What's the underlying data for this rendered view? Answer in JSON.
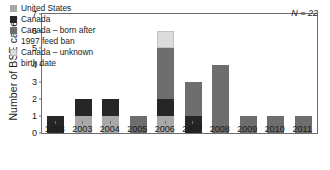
{
  "chart_data": {
    "type": "bar",
    "title": "",
    "subtitle": "",
    "xlabel": "",
    "ylabel": "Number of BSE cases",
    "ylim": [
      0,
      7
    ],
    "yticks": [
      0,
      1,
      2,
      3,
      4,
      5,
      6,
      7
    ],
    "grid": false,
    "stacked": true,
    "legend_position": "top-left",
    "annotation": "N = 22",
    "categories": [
      "1993",
      "2003",
      "2004",
      "2005",
      "2006",
      "2007",
      "2008",
      "2009",
      "2010",
      "2011"
    ],
    "series": [
      {
        "name": "United States",
        "color": "#a8a8a8",
        "values": [
          0,
          1,
          1,
          0,
          1,
          0,
          0,
          0,
          0,
          0
        ]
      },
      {
        "name": "Canada",
        "color": "#262626",
        "values": [
          1,
          1,
          1,
          0,
          1,
          1,
          0,
          0,
          0,
          0
        ]
      },
      {
        "name": "Canada – born after 1997 feed ban",
        "color": "#6e6e6e",
        "values": [
          0,
          0,
          0,
          1,
          3,
          2,
          4,
          1,
          1,
          1
        ]
      },
      {
        "name": "Canada – unknown birth date",
        "color": "#dcdcdc",
        "values": [
          0,
          0,
          0,
          0,
          1,
          0,
          0,
          0,
          0,
          0
        ]
      }
    ],
    "totals": [
      1,
      2,
      2,
      1,
      6,
      3,
      4,
      1,
      1,
      1
    ]
  },
  "legend": {
    "entries": [
      {
        "label": "United States",
        "color": "#a8a8a8"
      },
      {
        "label": "Canada",
        "color": "#262626"
      },
      {
        "label": "Canada – born after\n1997 feed ban",
        "color": "#6e6e6e"
      },
      {
        "label": "Canada – unknown\nbirth date",
        "color": "#dcdcdc"
      }
    ]
  },
  "axes": {
    "y_title": "Number of BSE cases",
    "y_tick_labels": [
      "0",
      "1",
      "2",
      "3",
      "4",
      "5",
      "6",
      "7"
    ],
    "x_tick_labels": [
      "1993",
      "2003",
      "2004",
      "2005",
      "2006",
      "2007",
      "2008",
      "2009",
      "2010",
      "2011"
    ]
  },
  "annotations": {
    "sample_size": "N = 22"
  },
  "colors": {
    "frame": "#6d6d6d",
    "background": "#ffffff",
    "text": "#1a1a1a",
    "swatch_border": "#9a9a9a"
  }
}
